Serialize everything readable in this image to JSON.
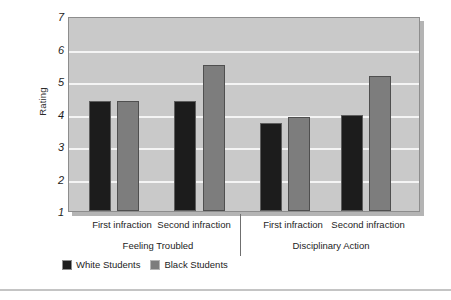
{
  "chart_data": {
    "type": "bar",
    "title": "",
    "xlabel": "",
    "ylabel": "Rating",
    "ylim": [
      1,
      7
    ],
    "yticks": [
      1,
      2,
      3,
      4,
      5,
      6,
      7
    ],
    "ytick_labels": [
      "1",
      "2",
      "3",
      "4",
      "5",
      "6",
      "7"
    ],
    "grid": true,
    "grid_axis": "y",
    "legend_position": "bottom-left",
    "panels": [
      {
        "name": "Feeling Troubled",
        "categories": [
          "First infraction",
          "Second infraction"
        ]
      },
      {
        "name": "Disciplinary Action",
        "categories": [
          "First infraction",
          "Second infraction"
        ]
      }
    ],
    "categories": [
      "Feeling Troubled - First infraction",
      "Feeling Troubled - Second infraction",
      "Disciplinary Action - First infraction",
      "Disciplinary Action - Second infraction"
    ],
    "series": [
      {
        "name": "White Students",
        "color": "#1c1c1c",
        "values": [
          4.4,
          4.4,
          3.7,
          3.95
        ]
      },
      {
        "name": "Black Students",
        "color": "#7d7d7d",
        "values": [
          4.4,
          5.5,
          3.9,
          5.15
        ]
      }
    ]
  },
  "axis": {
    "y_title": "Rating",
    "tick_labels": [
      "7",
      "6",
      "5",
      "4",
      "3",
      "2",
      "1"
    ]
  },
  "category_labels": [
    {
      "text": "First infraction",
      "x": 122
    },
    {
      "text": "Second infraction",
      "x": 194
    },
    {
      "text": "First infraction",
      "x": 293
    },
    {
      "text": "Second infraction",
      "x": 368
    }
  ],
  "group_labels": [
    {
      "text": "Feeling Troubled",
      "x": 158
    },
    {
      "text": "Disciplinary Action",
      "x": 331
    }
  ],
  "legend": {
    "items": [
      {
        "label": "White Students",
        "swatch": "white-students"
      },
      {
        "label": "Black Students",
        "swatch": "black-students"
      }
    ]
  },
  "colors": {
    "plot_background": "#c9c9c9",
    "gridline": "#f4f4f4",
    "white_students_bar": "#1c1c1c",
    "black_students_bar": "#7d7d7d",
    "axis_text": "#242424",
    "bottom_rule": "#c4c4c4"
  },
  "bar_geometry": [
    {
      "series": "White Students",
      "left": 20,
      "width": 22,
      "value": 4.4
    },
    {
      "series": "Black Students",
      "left": 48,
      "width": 22,
      "value": 4.4
    },
    {
      "series": "White Students",
      "left": 105,
      "width": 22,
      "value": 4.4
    },
    {
      "series": "Black Students",
      "left": 134,
      "width": 22,
      "value": 5.5
    },
    {
      "series": "White Students",
      "left": 191,
      "width": 22,
      "value": 3.7
    },
    {
      "series": "Black Students",
      "left": 219,
      "width": 22,
      "value": 3.9
    },
    {
      "series": "White Students",
      "left": 272,
      "width": 22,
      "value": 3.95
    },
    {
      "series": "Black Students",
      "left": 300,
      "width": 22,
      "value": 5.15
    }
  ]
}
